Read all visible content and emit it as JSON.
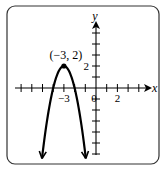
{
  "chart_data": {
    "type": "line",
    "title": "",
    "xlabel": "x",
    "ylabel": "y",
    "x_tick_labels": [
      {
        "value": -3,
        "label": "−3"
      },
      {
        "value": 0,
        "label": "0"
      },
      {
        "value": 2,
        "label": "2"
      }
    ],
    "y_tick_labels": [
      {
        "value": 2,
        "label": "2"
      }
    ],
    "xlim": [
      -7.5,
      5
    ],
    "ylim": [
      -6.5,
      5.5
    ],
    "grid": false,
    "series": [
      {
        "name": "parabola",
        "equation": "y = -2(x+3)^2 + 2",
        "vertex": [
          -3,
          2
        ],
        "x": [
          -5.1,
          -4.5,
          -4,
          -3.5,
          -3,
          -2.5,
          -2,
          -1.5,
          -0.9
        ],
        "y": [
          -6.8,
          -2.5,
          0,
          1.5,
          2,
          1.5,
          0,
          -2.5,
          -6.8
        ]
      }
    ],
    "annotations": [
      {
        "text": "(−3, 2)",
        "x": -3,
        "y": 2
      }
    ]
  }
}
